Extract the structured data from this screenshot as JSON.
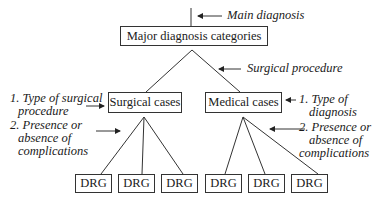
{
  "diagram": {
    "root": {
      "label": "Major diagnosis categories"
    },
    "children": [
      {
        "label": "Surgical cases",
        "leaves": [
          "DRG",
          "DRG",
          "DRG"
        ]
      },
      {
        "label": "Medical cases",
        "leaves": [
          "DRG",
          "DRG",
          "DRG"
        ]
      }
    ],
    "annotations": {
      "main_diagnosis": "Main diagnosis",
      "surgical_procedure": "Surgical procedure",
      "surgical_criteria": {
        "line1": "1. Type of surgical",
        "line2": "procedure",
        "line3": "2. Presence or",
        "line4": "absence of",
        "line5": "complications"
      },
      "medical_criteria": {
        "line1": "1. Type of",
        "line2": "diagnosis",
        "line3": "2. Presence or",
        "line4": "absence of",
        "line5": "complications"
      }
    }
  }
}
